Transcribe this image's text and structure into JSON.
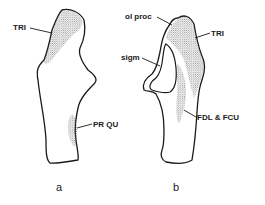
{
  "figure": {
    "panels": [
      {
        "id": "a",
        "label": "a",
        "annotations": [
          {
            "text": "TRI",
            "region": "proximal-stippled"
          },
          {
            "text": "PR QU",
            "region": "distal-stippled"
          }
        ]
      },
      {
        "id": "b",
        "label": "b",
        "annotations": [
          {
            "text": "ol proc",
            "region": "olecranon-process"
          },
          {
            "text": "TRI",
            "region": "proximal-stippled"
          },
          {
            "text": "sigm",
            "region": "sigmoid-notch"
          },
          {
            "text": "FDL & FCU",
            "region": "medial-stippled"
          }
        ]
      }
    ],
    "colors": {
      "ink": "#1a1a1a",
      "background": "#ffffff",
      "stipple": "#555555"
    }
  }
}
